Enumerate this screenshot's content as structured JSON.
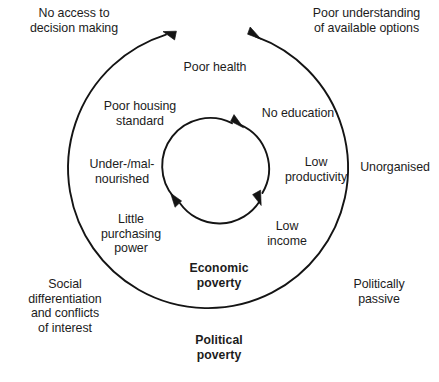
{
  "diagram": {
    "title_visible": false,
    "type": "vicious-circle-diagram",
    "colors": {
      "stroke": "#141414",
      "text": "#1c1c1c",
      "background": "#ffffff"
    },
    "geometry": {
      "outer_circle": {
        "cx": 212,
        "cy": 171,
        "r": 140
      },
      "inner_circle": {
        "cx": 218,
        "cy": 170,
        "r": 48
      }
    },
    "outer_ring_labels": [
      {
        "id": "poor-health",
        "text": "Poor health"
      },
      {
        "id": "poor-housing-standard",
        "text": "Poor housing\nstandard"
      },
      {
        "id": "under-malnourished",
        "text": "Under-/mal-\nnourished"
      },
      {
        "id": "little-purchasing-power",
        "text": "Little\npurchasing\npower"
      },
      {
        "id": "low-income",
        "text": "Low\nincome"
      },
      {
        "id": "low-productivity",
        "text": "Low\nproductivity"
      },
      {
        "id": "no-education",
        "text": "No education"
      }
    ],
    "outside_labels": [
      {
        "id": "no-access-decision-making",
        "text": "No access to\ndecision making"
      },
      {
        "id": "poor-understanding-options",
        "text": "Poor understanding\nof available options"
      },
      {
        "id": "unorganised",
        "text": "Unorganised"
      },
      {
        "id": "politically-passive",
        "text": "Politically\npassive"
      },
      {
        "id": "social-differentiation",
        "text": "Social\ndifferentiation\nand conflicts\nof interest"
      }
    ],
    "bold_labels": [
      {
        "id": "economic-poverty",
        "text": "Economic\npoverty"
      },
      {
        "id": "political-poverty",
        "text": "Political\npoverty"
      }
    ],
    "arrows": {
      "outer": [
        {
          "id": "outer-arrow-top-left",
          "direction": "counterclockwise-left",
          "at": [
            168,
            25
          ]
        },
        {
          "id": "outer-arrow-top-right",
          "direction": "clockwise-right",
          "at": [
            252,
            22
          ]
        }
      ],
      "inner": [
        {
          "id": "inner-arrow-top",
          "direction": "clockwise",
          "at": [
            238,
            124
          ]
        },
        {
          "id": "inner-arrow-right",
          "direction": "clockwise",
          "at": [
            259,
            199
          ]
        },
        {
          "id": "inner-arrow-bottom-left",
          "direction": "clockwise",
          "at": [
            176,
            199
          ]
        }
      ]
    }
  }
}
